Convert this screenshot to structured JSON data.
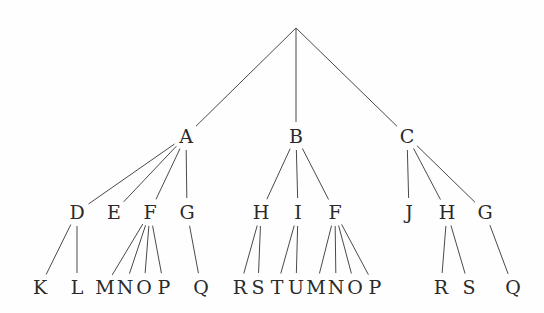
{
  "tree": {
    "root": {
      "label": "",
      "x": 296,
      "y": 28
    },
    "level1": [
      {
        "label": "A",
        "x": 186,
        "y": 136
      },
      {
        "label": "B",
        "x": 296,
        "y": 136
      },
      {
        "label": "C",
        "x": 407,
        "y": 136
      }
    ],
    "level2": [
      {
        "label": "D",
        "x": 77,
        "y": 212,
        "parent": 0
      },
      {
        "label": "E",
        "x": 114,
        "y": 212,
        "parent": 0
      },
      {
        "label": "F",
        "x": 150,
        "y": 212,
        "parent": 0
      },
      {
        "label": "G",
        "x": 187,
        "y": 212,
        "parent": 0
      },
      {
        "label": "H",
        "x": 261,
        "y": 212,
        "parent": 1
      },
      {
        "label": "I",
        "x": 298,
        "y": 212,
        "parent": 1
      },
      {
        "label": "F",
        "x": 335,
        "y": 212,
        "parent": 1
      },
      {
        "label": "J",
        "x": 409,
        "y": 212,
        "parent": 2
      },
      {
        "label": "H",
        "x": 447,
        "y": 212,
        "parent": 2
      },
      {
        "label": "G",
        "x": 485,
        "y": 212,
        "parent": 2
      }
    ],
    "level3": [
      {
        "label": "K",
        "x": 40,
        "y": 287,
        "parent": 0
      },
      {
        "label": "L",
        "x": 77,
        "y": 287,
        "parent": 0
      },
      {
        "label": "M",
        "x": 105,
        "y": 287,
        "parent": 2
      },
      {
        "label": "N",
        "x": 125,
        "y": 287,
        "parent": 2
      },
      {
        "label": "O",
        "x": 144,
        "y": 287,
        "parent": 2
      },
      {
        "label": "P",
        "x": 164,
        "y": 287,
        "parent": 2
      },
      {
        "label": "Q",
        "x": 201,
        "y": 287,
        "parent": 3
      },
      {
        "label": "R",
        "x": 240,
        "y": 287,
        "parent": 4
      },
      {
        "label": "S",
        "x": 258,
        "y": 287,
        "parent": 4
      },
      {
        "label": "T",
        "x": 277,
        "y": 287,
        "parent": 5
      },
      {
        "label": "U",
        "x": 296,
        "y": 287,
        "parent": 5
      },
      {
        "label": "M",
        "x": 316,
        "y": 287,
        "parent": 6
      },
      {
        "label": "N",
        "x": 336,
        "y": 287,
        "parent": 6
      },
      {
        "label": "O",
        "x": 355,
        "y": 287,
        "parent": 6
      },
      {
        "label": "P",
        "x": 375,
        "y": 287,
        "parent": 6
      },
      {
        "label": "R",
        "x": 441,
        "y": 287,
        "parent": 8
      },
      {
        "label": "S",
        "x": 469,
        "y": 287,
        "parent": 8
      },
      {
        "label": "Q",
        "x": 513,
        "y": 287,
        "parent": 9
      }
    ]
  },
  "colors": {
    "line": "#4a4a4a",
    "text": "#2a2a2a"
  }
}
